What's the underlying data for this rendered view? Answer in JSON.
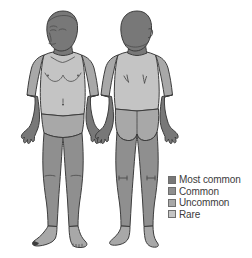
{
  "figure": {
    "background_color": "#ffffff",
    "views": [
      {
        "name": "anterior-view",
        "label": "Front view of human body"
      },
      {
        "name": "posterior-view",
        "label": "Back view of human body"
      }
    ]
  },
  "palette": {
    "most_common": "#787878",
    "common": "#8f8f8f",
    "uncommon": "#a8a8a8",
    "rare": "#c4c4c4",
    "outline": "#3d3d3d",
    "detail_line": "#5a5a5a"
  },
  "legend": {
    "items": [
      {
        "label": "Most common",
        "color": "#787878"
      },
      {
        "label": "Common",
        "color": "#8f8f8f"
      },
      {
        "label": "Uncommon",
        "color": "#a8a8a8"
      },
      {
        "label": "Rare",
        "color": "#c4c4c4"
      }
    ]
  },
  "regions": {
    "anterior": [
      {
        "part": "head-and-neck",
        "severity": "Most common"
      },
      {
        "part": "forearms-and-hands",
        "severity": "Most common"
      },
      {
        "part": "legs",
        "severity": "Common"
      },
      {
        "part": "upper-arms",
        "severity": "Uncommon"
      },
      {
        "part": "groin",
        "severity": "Uncommon"
      },
      {
        "part": "feet",
        "severity": "Uncommon"
      },
      {
        "part": "chest-and-abdomen",
        "severity": "Rare"
      }
    ],
    "posterior": [
      {
        "part": "head-and-neck",
        "severity": "Most common"
      },
      {
        "part": "forearms-and-hands",
        "severity": "Most common"
      },
      {
        "part": "legs",
        "severity": "Common"
      },
      {
        "part": "upper-arms",
        "severity": "Uncommon"
      },
      {
        "part": "buttocks",
        "severity": "Uncommon"
      },
      {
        "part": "feet",
        "severity": "Uncommon"
      },
      {
        "part": "back",
        "severity": "Rare"
      }
    ]
  }
}
